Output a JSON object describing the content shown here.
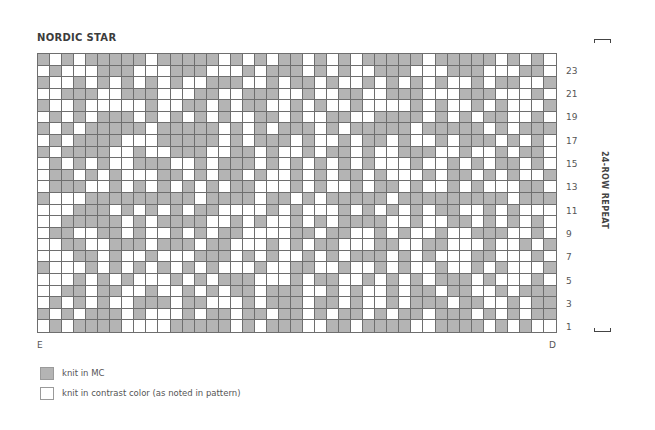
{
  "title": "NORDIC STAR",
  "chart_data": {
    "type": "heatmap",
    "title": "NORDIC STAR",
    "columns": 43,
    "rows": 24,
    "row_order": "top-to-bottom (row 24 first, row 1 last)",
    "legend_key": {
      "1": "knit in MC",
      "0": "knit in contrast color (as noted in pattern)"
    },
    "row_labels": [
      "23",
      "21",
      "19",
      "17",
      "15",
      "13",
      "11",
      "9",
      "7",
      "5",
      "3",
      "1"
    ],
    "grid": [
      "1010111110111110101011010101111101111101010",
      "0100011100011100010111010100111000111000110",
      "1001010101010011100101101001010101001011001",
      "0011100111000110011100100110011100011100010",
      "1001000001001101011001010010000101001010001",
      "0101011101010101001101001100111101010110010",
      "1010111110111110101011101011111011111010111",
      "0101111000111110101110100101101001011101010",
      "1011110010011100110100101101001110010010110",
      "0101010011100101110101010101000100101011010",
      "0110101000110101101001010110100010110101001",
      "0111001010101010110001010010110100101000110",
      "1000111111111011110110101111101111111110111",
      "0001110101010110000101000101010101100101000",
      "0011111010111100101001010111100100110101010",
      "0110011010010101100001101100101001001110010",
      "0011001110111011000101011000110011000100101",
      "0001101001000111010100101011101010001100010",
      "1000101010101010001001100100101001001010001",
      "0001010100010101110001011001010101110100010",
      "0011011001001010110111001010010110110010111",
      "0101010011101100010111011010010111011001011",
      "1010111010001011011011010110101101110101011",
      "0101111000011111010111001101111001111010100"
    ]
  },
  "axis": {
    "left_label": "E",
    "right_label": "D",
    "repeat_label": "24-ROW REPEAT"
  },
  "legend": [
    {
      "color": "#b4b4b4",
      "label": "knit in MC"
    },
    {
      "color": "#ffffff",
      "label": "knit in contrast color (as noted in pattern)"
    }
  ],
  "colors": {
    "mc": "#b4b4b4",
    "contrast": "#ffffff",
    "gridline": "#6e6e6e"
  }
}
